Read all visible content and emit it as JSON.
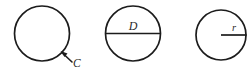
{
  "figure": {
    "background_color": "#ffffff",
    "stroke_color": "#1c1c1c",
    "label_color": "#2b2b2b",
    "canvas": {
      "width": 247,
      "height": 72
    }
  },
  "diagrams": [
    {
      "id": "circumference",
      "label": "C",
      "meaning": "circumference",
      "circle": {
        "cx": 42,
        "cy": 33.5,
        "r": 27.5
      },
      "annotation": {
        "type": "leader-arrow",
        "from": {
          "x": 72,
          "y": 62
        },
        "to": {
          "x": 61.5,
          "y": 52
        },
        "label_position": {
          "x": 73,
          "y": 66
        }
      }
    },
    {
      "id": "diameter",
      "label": "D",
      "meaning": "diameter",
      "circle": {
        "cx": 133,
        "cy": 33.5,
        "r": 27.5
      },
      "annotation": {
        "type": "chord-line",
        "from": {
          "x": 105.5,
          "y": 33.5
        },
        "to": {
          "x": 160.5,
          "y": 33.5
        },
        "label_position": {
          "x": 133,
          "y": 29
        }
      }
    },
    {
      "id": "radius",
      "label": "r",
      "meaning": "radius",
      "circle": {
        "cx": 221,
        "cy": 35,
        "r": 25
      },
      "annotation": {
        "type": "radius-line",
        "from": {
          "x": 221,
          "y": 35
        },
        "to": {
          "x": 246,
          "y": 35
        },
        "label_position": {
          "x": 234,
          "y": 30
        }
      }
    }
  ]
}
